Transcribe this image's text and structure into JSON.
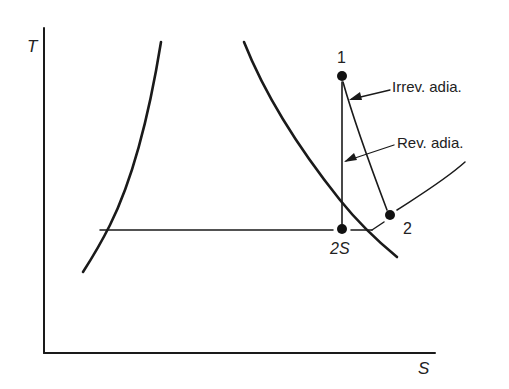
{
  "diagram": {
    "axes": {
      "y_label": "T",
      "x_label": "S"
    },
    "points": [
      {
        "id": "1",
        "label": "1"
      },
      {
        "id": "2s",
        "label": "2S"
      },
      {
        "id": "2",
        "label": "2"
      }
    ],
    "annotations": {
      "irreversible": "Irrev. adia.",
      "reversible": "Rev. adia."
    },
    "colors": {
      "ink": "#1a1a1a",
      "background": "#ffffff"
    }
  }
}
